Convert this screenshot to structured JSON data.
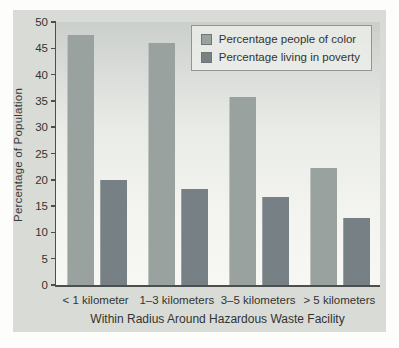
{
  "figure": {
    "panel_background": "#d9dcd6",
    "plot_background_top": "#cbcfcb",
    "plot_background_bottom": "#f7f7f4",
    "axis_color": "#4b4f4e",
    "text_color": "#333333"
  },
  "chart_data": {
    "type": "bar",
    "title": "",
    "categories": [
      "< 1 kilometer",
      "1–3 kilometers",
      "3–5 kilometers",
      "> 5 kilometers"
    ],
    "series": [
      {
        "name": "Percentage people of color",
        "color": "#99a29e",
        "values": [
          47.6,
          46.0,
          35.7,
          22.2
        ]
      },
      {
        "name": "Percentage living in poverty",
        "color": "#778084",
        "values": [
          20.0,
          18.3,
          16.8,
          12.7
        ]
      }
    ],
    "xlabel": "Within Radius Around Hazardous Waste Facility",
    "ylabel": "Percentage of Population",
    "ylim": [
      0,
      50
    ],
    "yticks": [
      0,
      5,
      10,
      15,
      20,
      25,
      30,
      35,
      40,
      45,
      50
    ],
    "grid": false,
    "legend_position": "top-right"
  }
}
